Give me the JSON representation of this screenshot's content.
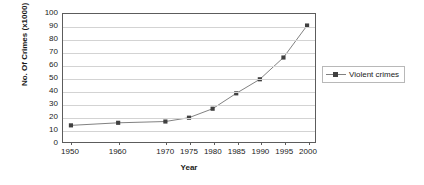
{
  "chart_data": {
    "type": "line",
    "title": "",
    "xlabel": "Year",
    "ylabel": "No. Of Crimes (x1000)",
    "categories": [
      "1950",
      "1960",
      "1970",
      "1975",
      "1980",
      "1985",
      "1990",
      "1995",
      "2000"
    ],
    "series": [
      {
        "name": "Violent crimes",
        "values": [
          13,
          15,
          16,
          19,
          26,
          38,
          49,
          66,
          91
        ],
        "color": "#808080",
        "marker": "square",
        "marker_color": "#404040"
      }
    ],
    "ylim": [
      0,
      100
    ],
    "ytick_step": 10,
    "yticks": [
      "100",
      "90",
      "80",
      "70",
      "60",
      "50",
      "40",
      "30",
      "20",
      "10",
      "0"
    ],
    "grid": "horizontal",
    "legend_position": "right",
    "plot_border_color": "#5c5c5c",
    "gridline_color": "#d3d3d3",
    "background": "#ffffff"
  }
}
